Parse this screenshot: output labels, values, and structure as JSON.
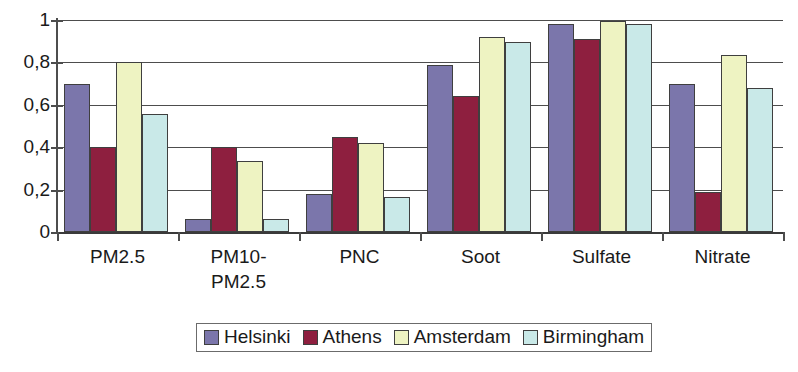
{
  "chart_data": {
    "type": "bar",
    "title": "",
    "subtitle": "",
    "xlabel": "",
    "ylabel": "",
    "ylim": [
      0,
      1
    ],
    "ytick_labels": [
      "0",
      "0,2",
      "0,4",
      "0,6",
      "0,8",
      "1"
    ],
    "ytick_values": [
      0,
      0.2,
      0.4,
      0.6,
      0.8,
      1
    ],
    "grid": true,
    "grid_axis": "y",
    "legend_position": "bottom-center",
    "categories": [
      "PM2.5",
      "PM10-\nPM2.5",
      "PNC",
      "Soot",
      "Sulfate",
      "Nitrate"
    ],
    "series": [
      {
        "name": "Helsinki",
        "color": "#7b76ab",
        "values": [
          0.7,
          0.06,
          0.18,
          0.79,
          0.98,
          0.7
        ]
      },
      {
        "name": "Athens",
        "color": "#8e1f3f",
        "values": [
          0.4,
          0.4,
          0.45,
          0.64,
          0.91,
          0.19
        ]
      },
      {
        "name": "Amsterdam",
        "color": "#eef3c2",
        "values": [
          0.8,
          0.335,
          0.42,
          0.92,
          0.995,
          0.835
        ]
      },
      {
        "name": "Birmingham",
        "color": "#c9e9e8",
        "values": [
          0.555,
          0.06,
          0.165,
          0.895,
          0.98,
          0.68
        ]
      }
    ]
  },
  "legend": {
    "items": [
      {
        "label": "Helsinki",
        "color": "#7b76ab"
      },
      {
        "label": "Athens",
        "color": "#8e1f3f"
      },
      {
        "label": "Amsterdam",
        "color": "#eef3c2"
      },
      {
        "label": "Birmingham",
        "color": "#c9e9e8"
      }
    ]
  },
  "axes": {
    "y_ticks": [
      "0",
      "0,2",
      "0,4",
      "0,6",
      "0,8",
      "1"
    ],
    "x_ticks": [
      "PM2.5",
      "PM10-\nPM2.5",
      "PNC",
      "Soot",
      "Sulfate",
      "Nitrate"
    ]
  }
}
